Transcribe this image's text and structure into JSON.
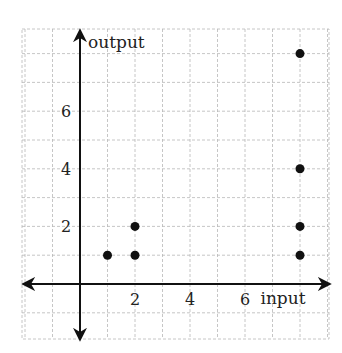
{
  "chart_data": {
    "type": "scatter",
    "title": "",
    "xlabel": "input",
    "ylabel": "output",
    "x_ticks": [
      2,
      4,
      6
    ],
    "y_ticks": [
      2,
      4,
      6
    ],
    "xlim": [
      -2,
      9
    ],
    "ylim": [
      -2,
      8.9
    ],
    "grid": true,
    "grid_style": "dashed",
    "legend": null,
    "points": [
      {
        "x": 1,
        "y": 1
      },
      {
        "x": 2,
        "y": 1
      },
      {
        "x": 2,
        "y": 2
      },
      {
        "x": 8,
        "y": 1
      },
      {
        "x": 8,
        "y": 2
      },
      {
        "x": 8,
        "y": 4
      },
      {
        "x": 8,
        "y": 8
      }
    ]
  },
  "colors": {
    "axis": "#111111",
    "grid": "#b8b8b8",
    "point": "#111111",
    "text": "#222222"
  }
}
